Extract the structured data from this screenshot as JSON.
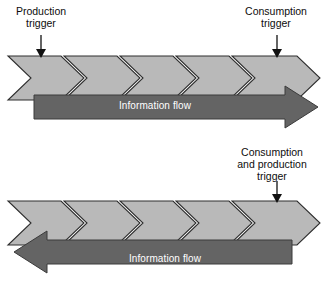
{
  "figure": {
    "background_color": "#ffffff"
  },
  "colors": {
    "chevron_fill": "#b9b9b9",
    "chevron_stroke": "#2e2e2e",
    "chevron_gap": "#ffffff",
    "flow_bar_fill": "#646464",
    "flow_bar_stroke": "#3a3a3a",
    "flow_label_color": "#ffffff",
    "trigger_arrow_color": "#111111",
    "caption_color": "#0d0d0d"
  },
  "top_diagram": {
    "name": "push-flow-diagram",
    "chevron_count": 5,
    "chevron_direction": "right",
    "flow": {
      "label": "Information flow",
      "direction": "right"
    },
    "triggers": [
      {
        "id": "production-trigger",
        "lines": [
          "Production",
          "trigger"
        ],
        "arrow_direction": "down",
        "target_chevron_index": 1
      },
      {
        "id": "consumption-trigger",
        "lines": [
          "Consumption",
          "trigger"
        ],
        "arrow_direction": "down",
        "target_chevron_index": 5
      }
    ]
  },
  "bottom_diagram": {
    "name": "pull-flow-diagram",
    "chevron_count": 5,
    "chevron_direction": "right",
    "flow": {
      "label": "Information flow",
      "direction": "left"
    },
    "triggers": [
      {
        "id": "consumption-and-production-trigger",
        "lines": [
          "Consumption",
          "and production",
          "trigger"
        ],
        "arrow_direction": "down",
        "target_chevron_index": 5
      }
    ]
  }
}
